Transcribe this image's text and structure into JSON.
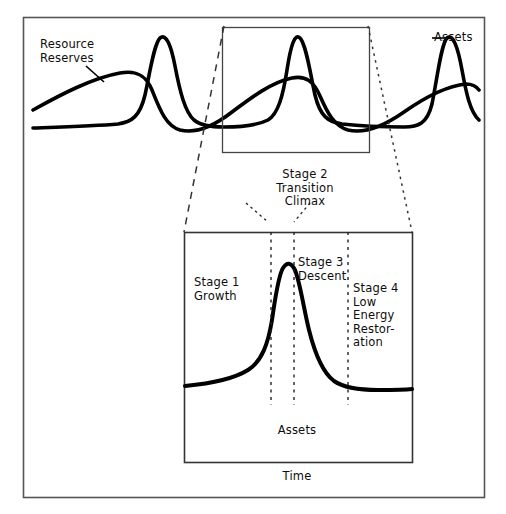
{
  "figure": {
    "type": "diagram",
    "outer_frame": {
      "x": 23,
      "y": 17,
      "width": 461,
      "height": 480
    },
    "top_panel": {
      "series": [
        {
          "name": "Resource Reserves",
          "label": "Resource\nReserves",
          "shape": "slow broad wave"
        },
        {
          "name": "Assets",
          "label": "Assets",
          "shape": "sharp narrow peaks"
        }
      ],
      "zoom_box": {
        "x": 222,
        "y": 27,
        "width": 147,
        "height": 125
      }
    },
    "detail_panel": {
      "box": {
        "x": 184,
        "y": 232,
        "width": 228,
        "height": 230
      },
      "xlabel": "Time",
      "series_label": "Assets",
      "dividers_x": [
        271,
        294,
        348
      ]
    }
  },
  "labels": {
    "resource_reserves": "Resource\nReserves",
    "assets": "Assets",
    "assets_inner": "Assets",
    "time": "Time",
    "stage2": "Stage 2\nTransition\nClimax",
    "stage1": "Stage 1\nGrowth",
    "stage3": "Stage 3\nDescent",
    "stage4": "Stage 4\nLow\nEnergy\nRestor-\nation"
  },
  "colors": {
    "ink": "#111111",
    "frame": "#4a4a4a",
    "background": "#ffffff",
    "curve": "#000000"
  }
}
